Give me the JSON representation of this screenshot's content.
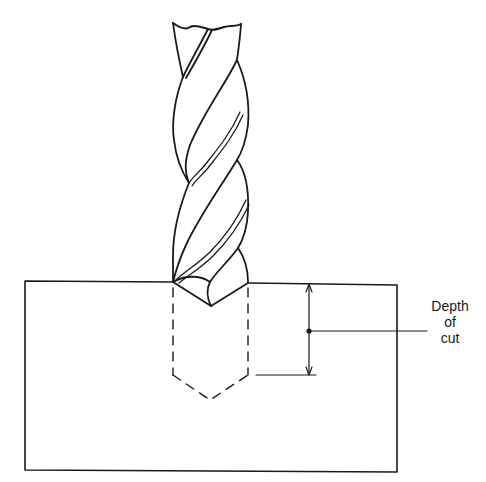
{
  "figure": {
    "label": {
      "lines": [
        "Depth",
        "of",
        "cut"
      ]
    },
    "colors": {
      "ink": "#1a1a1a",
      "background": "#ffffff"
    }
  }
}
